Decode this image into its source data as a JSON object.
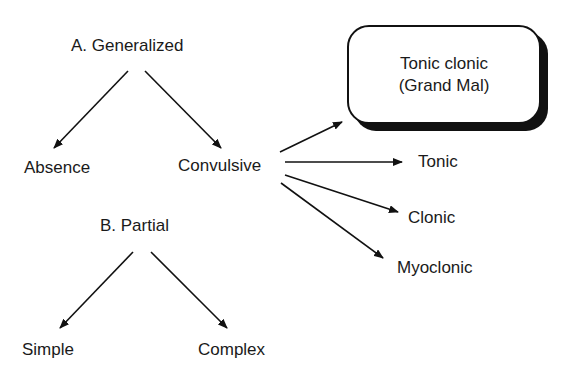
{
  "diagram": {
    "generalized": {
      "title": "A. Generalized",
      "children": {
        "absence": "Absence",
        "convulsive": "Convulsive"
      },
      "convulsive_children": {
        "tonic_clonic_line1": "Tonic clonic",
        "tonic_clonic_line2": "(Grand Mal)",
        "tonic": "Tonic",
        "clonic": "Clonic",
        "myoclonic": "Myoclonic"
      }
    },
    "partial": {
      "title": "B. Partial",
      "children": {
        "simple": "Simple",
        "complex": "Complex"
      }
    }
  }
}
